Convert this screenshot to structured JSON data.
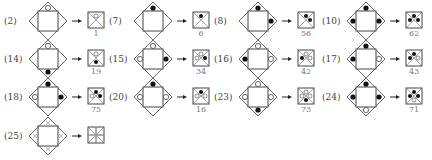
{
  "colors": {
    "stroke": "#444444",
    "filled": "#111111",
    "open": "#ffffff",
    "label": "#444444",
    "result_num": "#777777"
  },
  "items": [
    {
      "label": "(2)",
      "result": "1",
      "top": "open",
      "right": "none",
      "bottom": "none",
      "left": "none"
    },
    {
      "label": "(7)",
      "result": "6",
      "top": "filled",
      "right": "none",
      "bottom": "none",
      "left": "none"
    },
    {
      "label": "(8)",
      "result": "56",
      "top": "filled",
      "right": "filled",
      "bottom": "none",
      "left": "none"
    },
    {
      "label": "(10)",
      "result": "62",
      "top": "filled",
      "right": "filled",
      "bottom": "none",
      "left": "filled"
    },
    {
      "label": "(14)",
      "result": "19",
      "top": "open",
      "right": "none",
      "bottom": "filled",
      "left": "none"
    },
    {
      "label": "(15)",
      "result": "34",
      "top": "open",
      "right": "filled",
      "bottom": "none",
      "left": "open"
    },
    {
      "label": "(16)",
      "result": "42",
      "top": "open",
      "right": "open",
      "bottom": "none",
      "left": "filled"
    },
    {
      "label": "(17)",
      "result": "43",
      "top": "filled",
      "right": "open",
      "bottom": "none",
      "left": "filled"
    },
    {
      "label": "(18)",
      "result": "75",
      "top": "filled",
      "right": "filled",
      "bottom": "none",
      "left": "open"
    },
    {
      "label": "(20)",
      "result": "16",
      "top": "filled",
      "right": "open",
      "bottom": "none",
      "left": "open"
    },
    {
      "label": "(23)",
      "result": "73",
      "top": "open",
      "right": "open",
      "bottom": "filled",
      "left": "open"
    },
    {
      "label": "(24)",
      "result": "71",
      "top": "filled",
      "right": "filled",
      "bottom": "open",
      "left": "filled"
    },
    {
      "label": "(25)",
      "result": "",
      "top": "mark",
      "right": "mark",
      "bottom": "mark",
      "left": "mark"
    }
  ]
}
